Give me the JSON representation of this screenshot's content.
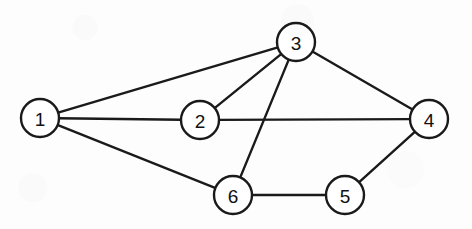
{
  "figure": {
    "background_color": "#fdfdfd",
    "stroke_color": "#1a1a1a",
    "node_fill_color": "#ffffff",
    "label_color": "#111111"
  },
  "chart_data": {
    "type": "diagram",
    "graph_type": "undirected graph",
    "title": "",
    "node_count": 6,
    "edge_count": 9,
    "node_radius": 19,
    "nodes": [
      {
        "id": "1",
        "label": "1",
        "x": 40,
        "y": 118
      },
      {
        "id": "2",
        "label": "2",
        "x": 200,
        "y": 120
      },
      {
        "id": "3",
        "label": "3",
        "x": 296,
        "y": 42
      },
      {
        "id": "4",
        "label": "4",
        "x": 429,
        "y": 119
      },
      {
        "id": "5",
        "label": "5",
        "x": 345,
        "y": 195
      },
      {
        "id": "6",
        "label": "6",
        "x": 233,
        "y": 195
      }
    ],
    "edges": [
      {
        "source": "1",
        "target": "3"
      },
      {
        "source": "1",
        "target": "2"
      },
      {
        "source": "1",
        "target": "6"
      },
      {
        "source": "2",
        "target": "3"
      },
      {
        "source": "2",
        "target": "4"
      },
      {
        "source": "3",
        "target": "4"
      },
      {
        "source": "3",
        "target": "6"
      },
      {
        "source": "4",
        "target": "5"
      },
      {
        "source": "5",
        "target": "6"
      }
    ],
    "adjacency": {
      "1": [
        "2",
        "3",
        "6"
      ],
      "2": [
        "1",
        "3",
        "4"
      ],
      "3": [
        "1",
        "2",
        "4",
        "6"
      ],
      "4": [
        "2",
        "3",
        "5"
      ],
      "5": [
        "4",
        "6"
      ],
      "6": [
        "1",
        "3",
        "5"
      ]
    },
    "degrees": {
      "1": 3,
      "2": 3,
      "3": 4,
      "4": 3,
      "5": 2,
      "6": 3
    },
    "crossings": [
      {
        "edge_a": "3-6",
        "edge_b": "2-4"
      }
    ],
    "legend": [],
    "annotations": []
  }
}
